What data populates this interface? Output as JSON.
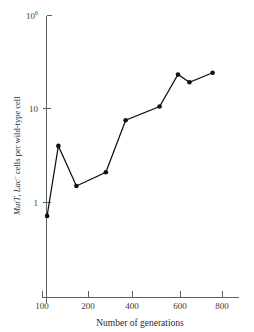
{
  "chart_data": {
    "type": "line",
    "title": "",
    "xlabel": "Number of generations",
    "ylabel": "MutT, Lac⁻ cells per wild-type cell",
    "ylabel_parts": {
      "italic_1": "MutT",
      "comma": ", ",
      "italic_2": "Lac",
      "superscript": "−",
      "rest": " cells per wild-type cell"
    },
    "xscale": "log",
    "yscale": "log",
    "xlim": [
      100,
      850
    ],
    "ylim": [
      0.55,
      1000000
    ],
    "grid": false,
    "legend": null,
    "xticks": [
      {
        "value": 100,
        "label": "100"
      },
      {
        "value": 200,
        "label": "200"
      },
      {
        "value": 400,
        "label": "400"
      },
      {
        "value": 600,
        "label": "600"
      },
      {
        "value": 800,
        "label": "800"
      }
    ],
    "yticks": [
      {
        "value": 1000000,
        "label": "10",
        "exponent": "6"
      },
      {
        "value": 10,
        "label": "10",
        "exponent": ""
      },
      {
        "value": 1,
        "label": "1",
        "exponent": ""
      }
    ],
    "series": [
      {
        "name": "MutT Lac- cells per wild-type cell",
        "marker": "filled-circle",
        "color": "#111111",
        "points": [
          {
            "x": 108,
            "y": 0.72
          },
          {
            "x": 128,
            "y": 4.0
          },
          {
            "x": 168,
            "y": 1.5
          },
          {
            "x": 265,
            "y": 2.1
          },
          {
            "x": 362,
            "y": 7.5
          },
          {
            "x": 505,
            "y": 10.5
          },
          {
            "x": 590,
            "y": 23.0
          },
          {
            "x": 640,
            "y": 19.0
          },
          {
            "x": 750,
            "y": 24.0
          }
        ]
      }
    ]
  },
  "colors": {
    "axis": "#5f5f5f",
    "data": "#111111",
    "background": "#ffffff",
    "text": "#2b2b2b"
  }
}
